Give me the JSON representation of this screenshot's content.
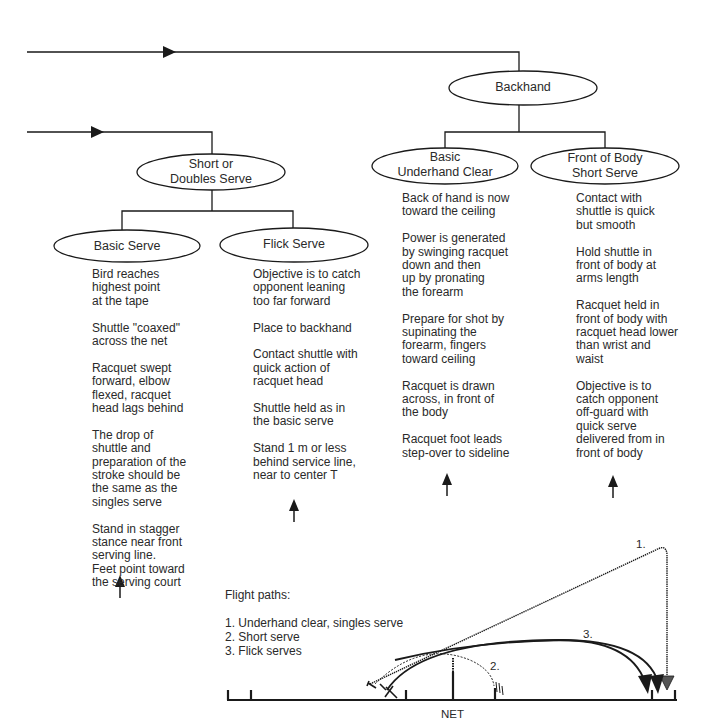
{
  "nodes": {
    "backhand": "Backhand",
    "basic_underhand_clear": "Basic\nUnderhand Clear",
    "front_of_body_short_serve": "Front of Body\nShort Serve",
    "short_or_doubles_serve": "Short or\nDoubles Serve",
    "basic_serve": "Basic Serve",
    "flick_serve": "Flick Serve"
  },
  "columns": {
    "basic_serve": [
      "Bird reaches\nhighest point\nat the tape",
      "Shuttle  \"coaxed\"\nacross the net",
      "Racquet swept\nforward, elbow\nflexed, racquet\nhead lags behind",
      "The drop of\nshuttle and\npreparation of the\nstroke should be\nthe same as the\nsingles serve",
      "Stand in stagger\nstance near front\nserving line.\nFeet point toward\nthe serving court"
    ],
    "flick_serve": [
      "Objective is to catch\nopponent leaning\ntoo far forward",
      "Place to backhand",
      "Contact shuttle with\nquick action of\nracquet head",
      "Shuttle held as in\nthe basic serve",
      "Stand 1 m or less\nbehind service line,\nnear to center T"
    ],
    "basic_underhand_clear": [
      "Back of hand is now\ntoward the ceiling",
      "Power is generated\nby swinging racquet\ndown and then\nup by pronating\nthe forearm",
      "Prepare for shot by\nsupinating the\nforearm, fingers\ntoward ceiling",
      "Racquet is drawn\nacross, in front of\nthe body",
      "Racquet foot leads\nstep-over to sideline"
    ],
    "front_of_body_short_serve": [
      "Contact with\nshuttle is quick\nbut smooth",
      "Hold shuttle in\nfront of body at\narms length",
      "Racquet held in\nfront of body with\nracquet head lower\nthan wrist and\nwaist",
      "Objective is to\ncatch opponent\noff-guard with\nquick serve\ndelivered from in\nfront of body"
    ]
  },
  "legend": {
    "title": "Flight paths:",
    "items": [
      "1. Underhand clear, singles serve",
      "2. Short serve",
      "3. Flick serves"
    ]
  },
  "flight_labels": {
    "path1": "1.",
    "path2": "2.",
    "path3": "3."
  },
  "court": {
    "net_label": "NET"
  },
  "colors": {
    "line": "#1a1a1a",
    "text": "#2a2a2a",
    "background": "#ffffff"
  }
}
